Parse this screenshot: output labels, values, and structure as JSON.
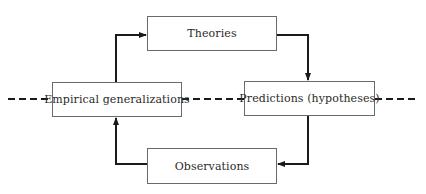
{
  "diagram": {
    "type": "cycle-flow",
    "nodes": [
      {
        "id": "theories",
        "label": "Theories"
      },
      {
        "id": "predictions",
        "label": "Predictions (hypotheses)"
      },
      {
        "id": "observations",
        "label": "Observations"
      },
      {
        "id": "empirical",
        "label": "Empirical generalizations"
      }
    ],
    "edges": [
      {
        "from": "theories",
        "to": "predictions",
        "style": "solid-arrow"
      },
      {
        "from": "predictions",
        "to": "observations",
        "style": "solid-arrow"
      },
      {
        "from": "observations",
        "to": "empirical",
        "style": "solid-arrow"
      },
      {
        "from": "empirical",
        "to": "theories",
        "style": "solid-arrow"
      }
    ],
    "divider": {
      "style": "dashed",
      "orientation": "horizontal",
      "through": [
        "empirical",
        "predictions"
      ]
    },
    "colors": {
      "line": "#1a1a1a",
      "box_border": "#6a6a6a",
      "text": "#2a2a2a",
      "background": "#ffffff"
    }
  }
}
